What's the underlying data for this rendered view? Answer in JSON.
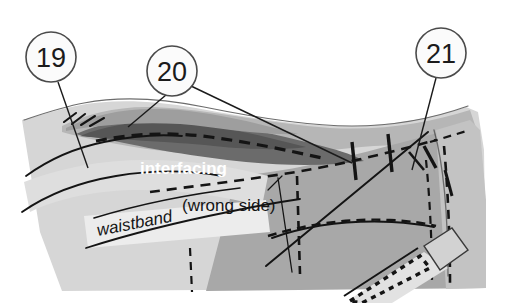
{
  "figure": {
    "type": "sewing-instruction-illustration",
    "background_color": "#ffffff",
    "width": 507,
    "height": 303
  },
  "callouts": [
    {
      "id": "callout-19",
      "number": "19",
      "cx": 51,
      "cy": 57,
      "r": 25
    },
    {
      "id": "callout-20",
      "number": "20",
      "cx": 172,
      "cy": 71,
      "r": 25
    },
    {
      "id": "callout-21",
      "number": "21",
      "cx": 441,
      "cy": 53,
      "r": 25
    }
  ],
  "labels": {
    "interfacing": "interfacing",
    "wrong_side": "(wrong side)",
    "waistband": "waistband"
  },
  "colors": {
    "paper": "#ffffff",
    "fabric_light": "#d6d6d6",
    "fabric_mid": "#b3b3b3",
    "fabric_body": "#a8a8a8",
    "interfacing_dark": "#6e6e6e",
    "interfacing_shadow": "#585858",
    "callout_stroke": "#4a4a4a",
    "line_ink": "#141414",
    "zipper_tape": "#cfcfcf",
    "label_text_light": "#ffffff",
    "label_text_dark": "#151515"
  }
}
